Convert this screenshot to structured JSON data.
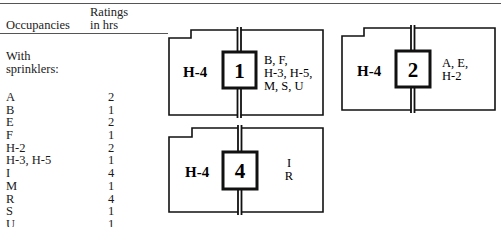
{
  "table": {
    "headers": {
      "occupancies": "Occupancies",
      "ratings_line1": "Ratings",
      "ratings_line2": "in hrs"
    },
    "section_label_line1": "With",
    "section_label_line2": "sprinklers:",
    "rows": [
      {
        "occupancy": "A",
        "rating": "2"
      },
      {
        "occupancy": "B",
        "rating": "1"
      },
      {
        "occupancy": "E",
        "rating": "2"
      },
      {
        "occupancy": "F",
        "rating": "1"
      },
      {
        "occupancy": "H-2",
        "rating": "2"
      },
      {
        "occupancy": "H-3, H-5",
        "rating": "1"
      },
      {
        "occupancy": "I",
        "rating": "4"
      },
      {
        "occupancy": "M",
        "rating": "1"
      },
      {
        "occupancy": "R",
        "rating": "4"
      },
      {
        "occupancy": "S",
        "rating": "1"
      },
      {
        "occupancy": "U",
        "rating": "1"
      }
    ]
  },
  "diagrams": [
    {
      "left_occupancy": "H-4",
      "rating": "1",
      "right_occupancies": [
        "B, F,",
        "H-3, H-5,",
        "M, S, U"
      ]
    },
    {
      "left_occupancy": "H-4",
      "rating": "2",
      "right_occupancies": [
        "A, E,",
        "H-2"
      ]
    },
    {
      "left_occupancy": "H-4",
      "rating": "4",
      "right_occupancies": [
        "I",
        "R"
      ]
    }
  ]
}
